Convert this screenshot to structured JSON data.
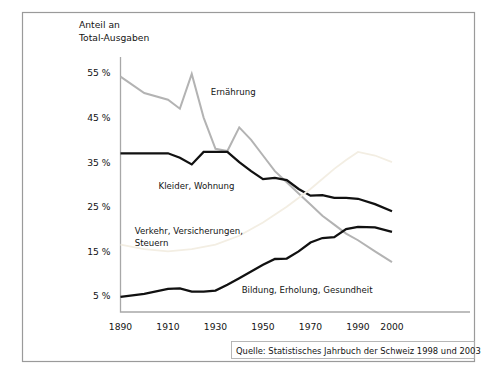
{
  "chart_data": {
    "type": "line",
    "title": "",
    "ylabel": "Anteil an Total-Ausgaben",
    "xlabel": "",
    "ylabel_line1": "Anteil an",
    "ylabel_line2": "Total-Ausgaben",
    "ytick_labels": [
      "55 %",
      "45 %",
      "35 %",
      "25 %",
      "15 %",
      "5 %"
    ],
    "ytick_values": [
      55,
      45,
      35,
      25,
      15,
      5
    ],
    "xtick_labels": [
      "1890",
      "1910",
      "1930",
      "1950",
      "1970",
      "1990",
      "2000"
    ],
    "xtick_values": [
      1890,
      1910,
      1930,
      1950,
      1970,
      1990,
      2000
    ],
    "xlim": [
      1890,
      2000
    ],
    "ylim": [
      0,
      60
    ],
    "grid": false,
    "legend_position": "inline-labels",
    "series": [
      {
        "name": "Ernährung",
        "color": "#b3b3b3",
        "width": 2.0,
        "label_x": 1928,
        "label_y": 50,
        "x": [
          1890,
          1900,
          1910,
          1915,
          1920,
          1925,
          1930,
          1935,
          1940,
          1945,
          1950,
          1955,
          1960,
          1965,
          1970,
          1975,
          1980,
          1985,
          1990,
          1995,
          2000
        ],
        "y": [
          54.2,
          50.5,
          49.0,
          47.0,
          54.8,
          45.0,
          38.0,
          37.5,
          42.8,
          40.0,
          36.5,
          33.0,
          30.5,
          28.0,
          25.5,
          23.0,
          21.0,
          19.0,
          17.5,
          15.0,
          12.6
        ]
      },
      {
        "name": "Kleider, Wohnung",
        "color": "#111111",
        "width": 2.3,
        "label_x": 1906,
        "label_y": 29,
        "x": [
          1890,
          1900,
          1910,
          1915,
          1920,
          1925,
          1930,
          1935,
          1940,
          1945,
          1950,
          1955,
          1960,
          1965,
          1970,
          1975,
          1980,
          1985,
          1990,
          1995,
          2000
        ],
        "y": [
          37.0,
          37.0,
          37.0,
          36.0,
          34.5,
          37.3,
          37.3,
          37.3,
          35.0,
          33.0,
          31.2,
          31.5,
          31.0,
          29.0,
          27.5,
          27.6,
          27.0,
          27.0,
          26.8,
          25.6,
          24.0
        ]
      },
      {
        "name": "Verkehr, Versicherungen, Steuern",
        "color": "#f3eee3",
        "width": 1.8,
        "label_x": 1896,
        "label_y": 19,
        "label_line1": "Verkehr, Versicherungen,",
        "label_line2": "Steuern",
        "x": [
          1890,
          1900,
          1910,
          1920,
          1930,
          1940,
          1950,
          1960,
          1970,
          1980,
          1985,
          1990,
          1995,
          2000
        ],
        "y": [
          16.5,
          15.5,
          15.0,
          15.5,
          16.5,
          18.5,
          21.5,
          25.0,
          29.0,
          33.5,
          35.5,
          37.3,
          36.5,
          35.0
        ]
      },
      {
        "name": "Bildung, Erholung, Gesundheit",
        "color": "#111111",
        "width": 2.3,
        "label_x": 1941,
        "label_y": 5.6,
        "x": [
          1890,
          1900,
          1910,
          1915,
          1920,
          1925,
          1930,
          1935,
          1940,
          1945,
          1950,
          1955,
          1960,
          1965,
          1970,
          1975,
          1980,
          1985,
          1990,
          1995,
          2000
        ],
        "y": [
          4.8,
          5.5,
          6.6,
          6.7,
          6.0,
          6.0,
          6.2,
          7.5,
          9.0,
          10.5,
          12.0,
          13.3,
          13.4,
          15.0,
          17.0,
          18.0,
          18.2,
          20.0,
          20.5,
          20.4,
          19.4
        ]
      }
    ]
  },
  "source": {
    "text": "Quelle: Statistisches Jahrbuch der Schweiz 1998 und 2003"
  }
}
